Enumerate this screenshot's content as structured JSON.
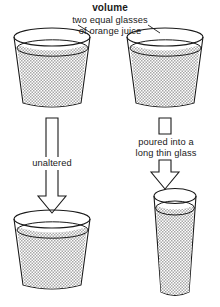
{
  "diagram": {
    "title": "volume",
    "caption": {
      "line1": "two equal glasses",
      "line2": "of orange juice"
    },
    "colors": {
      "outline": "#1a1a1a",
      "juice_stipple": "#8c8c8c",
      "background": "#ffffff",
      "text": "#1a1a1a"
    },
    "glasses": {
      "top_left": {
        "name": "wide tumbler",
        "shape": "tapered-tumbler",
        "contents": "orange juice",
        "fill_level": "near full"
      },
      "top_right": {
        "name": "wide tumbler",
        "shape": "tapered-tumbler",
        "contents": "orange juice",
        "fill_level": "near full"
      },
      "bottom_left": {
        "name": "wide tumbler",
        "shape": "tapered-tumbler",
        "contents": "orange juice",
        "fill_level": "near full"
      },
      "bottom_right": {
        "name": "long thin glass",
        "shape": "tall-narrow-glass",
        "contents": "orange juice",
        "fill_level": "near full"
      }
    },
    "arrows": {
      "left": {
        "label": "unaltered",
        "direction": "down"
      },
      "right": {
        "label_line1": "poured into a",
        "label_line2": "long thin glass",
        "direction": "down"
      }
    }
  }
}
